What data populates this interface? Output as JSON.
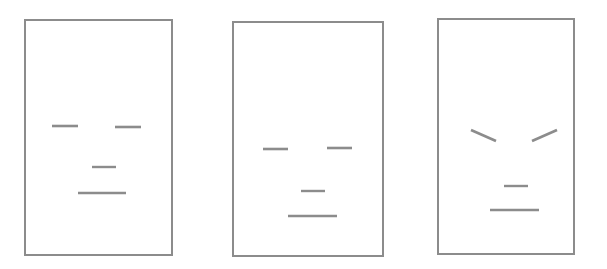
{
  "figure": {
    "title": "",
    "background_color": "#ffffff",
    "stroke_color": "#8c8c8c",
    "frame_color": "#8c8c8c",
    "width": 607,
    "height": 269,
    "panel_count": 3
  },
  "panels": [
    {
      "id": "panel-1",
      "name": "neutral-face-panel",
      "label": "",
      "frame": {
        "x": 25,
        "y": 20,
        "width": 147,
        "height": 235
      },
      "features": [
        {
          "name": "left-eye",
          "type": "line",
          "x1": 52,
          "y1": 126,
          "x2": 78,
          "y2": 126
        },
        {
          "name": "right-eye",
          "type": "line",
          "x1": 115,
          "y1": 127,
          "x2": 141,
          "y2": 127
        },
        {
          "name": "nose",
          "type": "line",
          "x1": 92,
          "y1": 167,
          "x2": 116,
          "y2": 167
        },
        {
          "name": "mouth",
          "type": "line",
          "x1": 78,
          "y1": 193,
          "x2": 126,
          "y2": 193
        }
      ]
    },
    {
      "id": "panel-2",
      "name": "neutral-face-panel-lowered",
      "label": "",
      "frame": {
        "x": 233,
        "y": 22,
        "width": 150,
        "height": 234
      },
      "features": [
        {
          "name": "left-eye",
          "type": "line",
          "x1": 263,
          "y1": 149,
          "x2": 288,
          "y2": 149
        },
        {
          "name": "right-eye",
          "type": "line",
          "x1": 327,
          "y1": 148,
          "x2": 352,
          "y2": 148
        },
        {
          "name": "nose",
          "type": "line",
          "x1": 301,
          "y1": 191,
          "x2": 325,
          "y2": 191
        },
        {
          "name": "mouth",
          "type": "line",
          "x1": 288,
          "y1": 216,
          "x2": 337,
          "y2": 216
        }
      ]
    },
    {
      "id": "panel-3",
      "name": "angry-face-panel",
      "label": "",
      "frame": {
        "x": 438,
        "y": 19,
        "width": 136,
        "height": 235
      },
      "features": [
        {
          "name": "left-eyebrow",
          "type": "line",
          "x1": 471,
          "y1": 130,
          "x2": 496,
          "y2": 141
        },
        {
          "name": "right-eyebrow",
          "type": "line",
          "x1": 532,
          "y1": 141,
          "x2": 557,
          "y2": 130
        },
        {
          "name": "nose",
          "type": "line",
          "x1": 504,
          "y1": 186,
          "x2": 528,
          "y2": 186
        },
        {
          "name": "mouth",
          "type": "line",
          "x1": 490,
          "y1": 210,
          "x2": 539,
          "y2": 210
        }
      ]
    }
  ]
}
